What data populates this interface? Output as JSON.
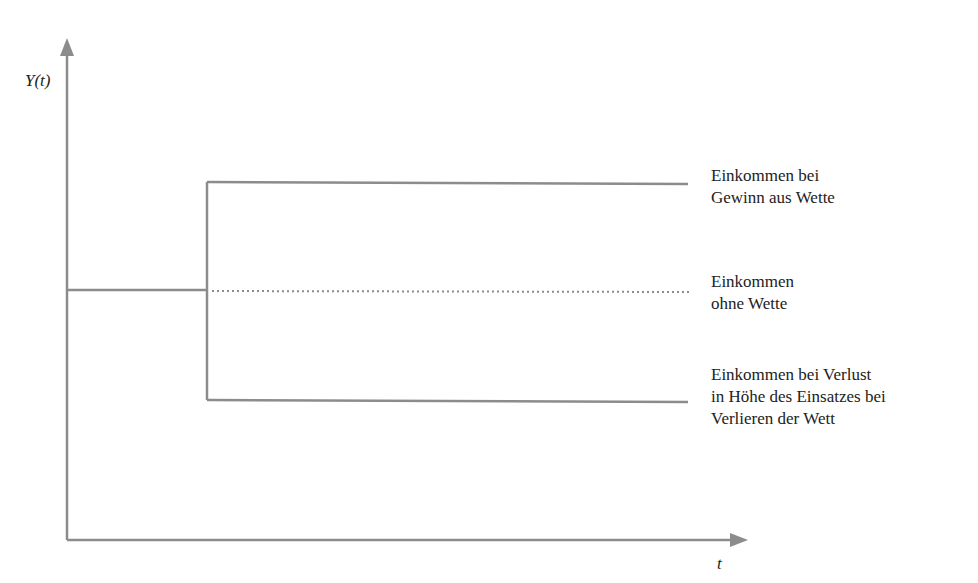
{
  "diagram": {
    "y_axis_label": "Y(t)",
    "x_axis_label": "t",
    "line_color": "#8c8c8c",
    "labels": {
      "win": [
        "Einkommen bei",
        "Gewinn aus Wette"
      ],
      "none": [
        "Einkommen",
        "ohne Wette"
      ],
      "loss": [
        "Einkommen bei Verlust",
        "in Höhe des Einsatzes bei",
        "Verlieren der Wett"
      ]
    }
  }
}
